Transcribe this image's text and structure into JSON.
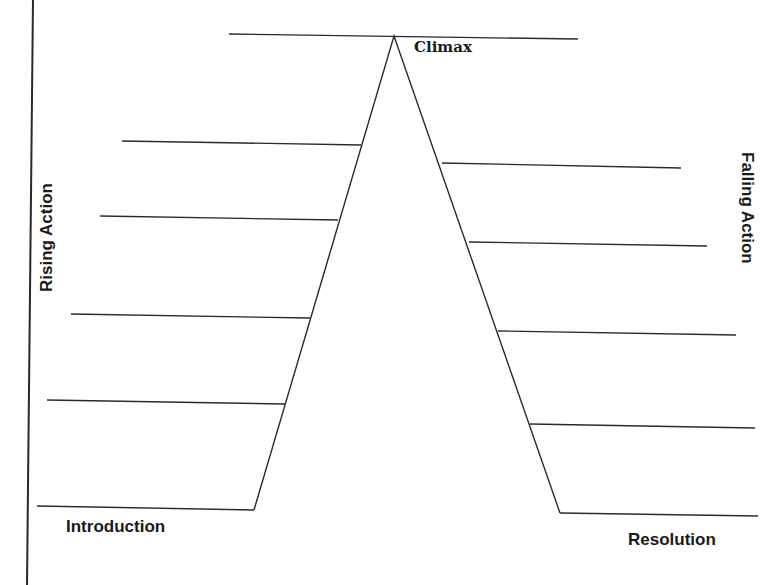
{
  "diagram": {
    "type": "plot-diagram",
    "stroke_color": "#2a2a2a",
    "labels": {
      "climax": "Climax",
      "rising_action": "Rising Action",
      "falling_action": "Falling Action",
      "introduction": "Introduction",
      "resolution": "Resolution"
    },
    "margin_line": {
      "x1": 33,
      "y1": 0,
      "x2": 27,
      "y2": 585
    },
    "mountain": {
      "left_base": [
        254,
        510
      ],
      "apex": [
        394,
        36
      ],
      "right_base": [
        560,
        513
      ]
    },
    "climax_line": {
      "x1": 229,
      "y1": 34,
      "x2": 578,
      "y2": 39
    },
    "rising_lines": [
      {
        "x1": 122,
        "y1": 141,
        "x2": 361,
        "y2": 145
      },
      {
        "x1": 100,
        "y1": 216,
        "x2": 338,
        "y2": 220
      },
      {
        "x1": 71,
        "y1": 314,
        "x2": 310,
        "y2": 318
      },
      {
        "x1": 47,
        "y1": 400,
        "x2": 285,
        "y2": 404
      }
    ],
    "introduction_line": {
      "x1": 37,
      "y1": 506,
      "x2": 254,
      "y2": 510
    },
    "falling_lines": [
      {
        "x1": 442,
        "y1": 163,
        "x2": 681,
        "y2": 168
      },
      {
        "x1": 469,
        "y1": 242,
        "x2": 707,
        "y2": 246
      },
      {
        "x1": 498,
        "y1": 331,
        "x2": 736,
        "y2": 335
      },
      {
        "x1": 530,
        "y1": 424,
        "x2": 755,
        "y2": 428
      }
    ],
    "resolution_line": {
      "x1": 560,
      "y1": 513,
      "x2": 758,
      "y2": 516
    }
  }
}
